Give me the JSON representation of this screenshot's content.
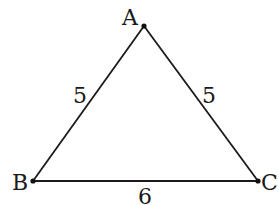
{
  "diagram": {
    "type": "triangle",
    "vertices": [
      {
        "id": "A",
        "label": "A",
        "x": 144,
        "y": 26,
        "label_x": 122,
        "label_y": 25
      },
      {
        "id": "B",
        "label": "B",
        "x": 33,
        "y": 181,
        "label_x": 12,
        "label_y": 190
      },
      {
        "id": "C",
        "label": "C",
        "x": 258,
        "y": 181,
        "label_x": 261,
        "label_y": 190
      }
    ],
    "edges": [
      {
        "from": "A",
        "to": "B",
        "length_label": "5",
        "label_x": 73,
        "label_y": 103
      },
      {
        "from": "A",
        "to": "C",
        "length_label": "5",
        "label_x": 202,
        "label_y": 103
      },
      {
        "from": "B",
        "to": "C",
        "length_label": "6",
        "label_x": 138,
        "label_y": 204
      }
    ],
    "colors": {
      "stroke": "#1a1a1a",
      "text": "#1a1a1a",
      "background": "#ffffff"
    }
  }
}
